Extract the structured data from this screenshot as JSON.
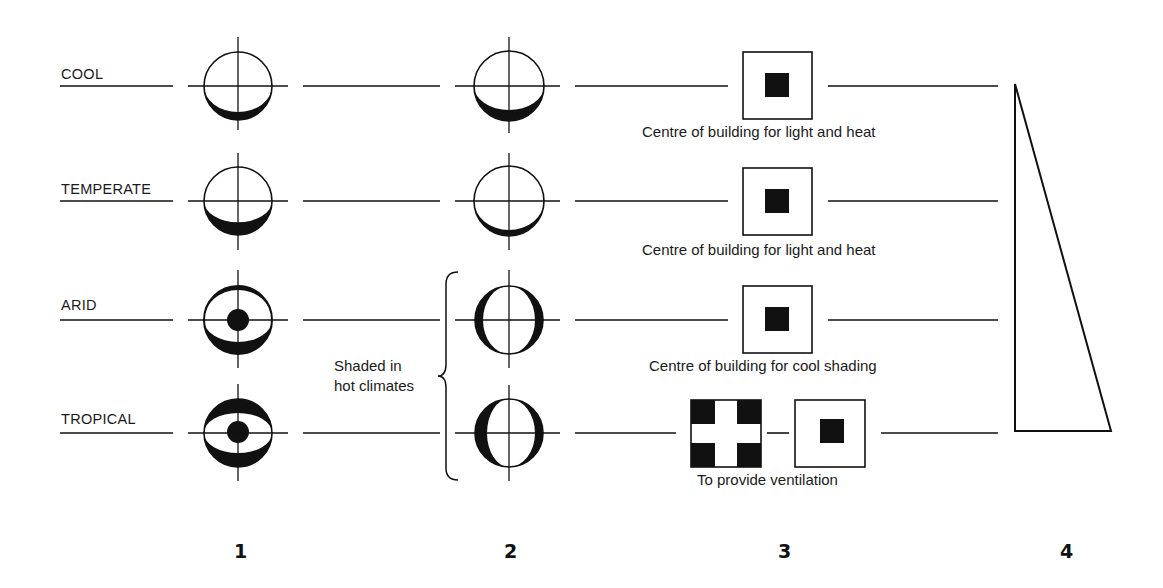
{
  "rows": [
    {
      "label": "COOL",
      "caption": "Centre of building for light and heat"
    },
    {
      "label": "TEMPERATE",
      "caption": "Centre of building for light and heat"
    },
    {
      "label": "ARID",
      "caption": "Centre of building for cool shading"
    },
    {
      "label": "TROPICAL",
      "caption": "To provide ventilation"
    }
  ],
  "brace_note": {
    "line1": "Shaded in",
    "line2": "hot climates"
  },
  "columns": [
    "1",
    "2",
    "3",
    "4"
  ],
  "icons": {
    "col1": [
      "sun-path-circle-bottom-crescent",
      "sun-path-circle-thick-crescent",
      "sun-path-circle-dot-crescents",
      "sun-path-circle-dot-thick-crescents"
    ],
    "col2": [
      "orientation-circle-bottom-crescent",
      "orientation-circle-bottom-crescent-thin",
      "orientation-circle-side-shading",
      "orientation-circle-side-shading-thick"
    ],
    "col3": [
      "building-plan-centre-core",
      "building-plan-centre-core",
      "building-plan-centre-core",
      "building-plan-cross-and-core"
    ],
    "col4": "tapering-triangle"
  },
  "colors": {
    "ink": "#111111",
    "background": "#ffffff"
  }
}
